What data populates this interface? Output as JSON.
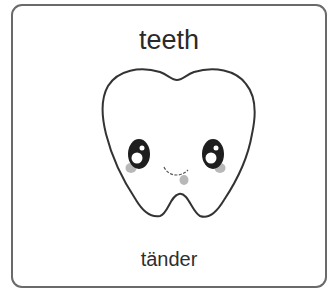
{
  "card": {
    "title": "teeth",
    "translation": "tänder",
    "illustration": {
      "icon": "tooth-icon",
      "description": "smiling cartoon tooth with eyes and blush",
      "colors": {
        "outline": "#333333",
        "eye": "#1e1e1e",
        "blush": "#b8b8b8",
        "border": "#6a6a6a"
      }
    }
  }
}
